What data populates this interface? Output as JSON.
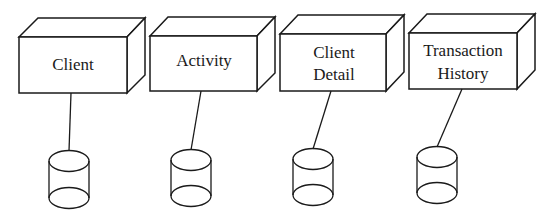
{
  "diagram": {
    "type": "deployment-nodes-with-datastores",
    "nodes": [
      {
        "id": "client",
        "label_lines": [
          "Client"
        ],
        "line1": "Client",
        "line2": ""
      },
      {
        "id": "activity",
        "label_lines": [
          "Activity"
        ],
        "line1": "Activity",
        "line2": ""
      },
      {
        "id": "client-detail",
        "label_lines": [
          "Client",
          "Detail"
        ],
        "line1": "Client",
        "line2": "Detail"
      },
      {
        "id": "transaction-history",
        "label_lines": [
          "Transaction",
          "History"
        ],
        "line1": "Transaction",
        "line2": "History"
      }
    ],
    "datastores": [
      {
        "attached_to": "client",
        "shape": "cylinder"
      },
      {
        "attached_to": "activity",
        "shape": "cylinder"
      },
      {
        "attached_to": "client-detail",
        "shape": "cylinder"
      },
      {
        "attached_to": "transaction-history",
        "shape": "cylinder"
      }
    ],
    "colors": {
      "stroke": "#1a1a1a",
      "background": "#ffffff"
    }
  }
}
